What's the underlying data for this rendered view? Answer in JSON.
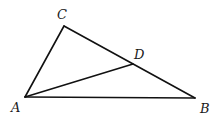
{
  "diagram": {
    "type": "triangle",
    "points": {
      "A": {
        "label": "A",
        "x": 25,
        "y": 97
      },
      "B": {
        "label": "B",
        "x": 195,
        "y": 98
      },
      "C": {
        "label": "C",
        "x": 64,
        "y": 26
      },
      "D": {
        "label": "D",
        "x": 133,
        "y": 64
      }
    },
    "segments": [
      "AB",
      "AC",
      "CB",
      "AD"
    ],
    "labels": {
      "A": "A",
      "B": "B",
      "C": "C",
      "D": "D"
    }
  }
}
